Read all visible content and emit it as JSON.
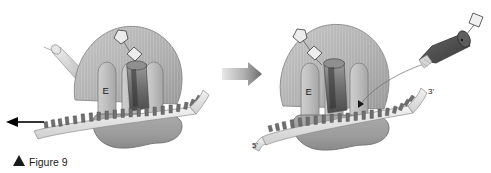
{
  "figure": {
    "caption_marker": "▲",
    "caption": "Figure 9",
    "background_color": "#ffffff"
  },
  "colors": {
    "large_subunit": "#b0b0b0",
    "large_subunit_edge": "#808080",
    "small_subunit": "#9a9a9a",
    "small_subunit_edge": "#6f6f6f",
    "site_column": "#bdbdbd",
    "site_column_edge": "#7d7d7d",
    "trna_light": "#d8d8d8",
    "trna_mid": "#9b9b9b",
    "trna_dark": "#585858",
    "mrna_ribbon": "#e2e2e2",
    "mrna_teeth": "#6e6e6e",
    "peptide_shape": "#e8e8e8",
    "peptide_shape_edge": "#555555",
    "transition_arrow": "#8c8c8c",
    "motion_arrow": "#000000",
    "text": "#1a1a1a"
  },
  "panels": [
    {
      "id": "left-panel",
      "name": "ribosome-before-translocation",
      "site_labels": [
        "E",
        "P",
        "A"
      ],
      "site_label_E": "E",
      "site_label_P": "P",
      "site_label_A": "A",
      "motion_arrow": {
        "name": "mrna-movement-arrow",
        "direction": "left",
        "color": "#000000"
      },
      "exiting_trna": {
        "name": "exiting-trna",
        "shade": "light"
      },
      "peptide_chain": {
        "name": "growing-polypeptide-chain",
        "residues": [
          "pentagon",
          "diamond"
        ]
      }
    },
    {
      "id": "right-panel",
      "name": "ribosome-after-translocation",
      "site_label_E": "E",
      "site_label_P": "P",
      "site_label_A": "A",
      "site_word_P": "site",
      "site_word_A": "site",
      "mrna_5_prime": "5'",
      "mrna_3_prime": "3'",
      "incoming_trna": {
        "name": "incoming-charged-trna",
        "shade": "dark",
        "cargo": "amino-acid-square"
      },
      "peptide_chain": {
        "name": "growing-polypeptide-chain",
        "residues": [
          "pentagon",
          "diamond"
        ]
      }
    }
  ],
  "transition": {
    "name": "step-transition-arrow",
    "direction": "right",
    "color": "#8c8c8c"
  }
}
